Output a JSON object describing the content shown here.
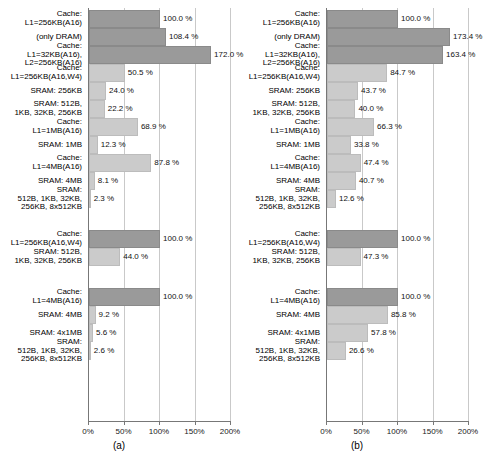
{
  "chart_data": [
    {
      "type": "bar",
      "orientation": "horizontal",
      "panel_id": "a",
      "caption": "(a)",
      "title": "",
      "xlabel": "",
      "ylabel": "",
      "xlim": [
        0,
        200
      ],
      "xticks": [
        0,
        50,
        100,
        150,
        200
      ],
      "xtick_labels": [
        "0%",
        "50%",
        "100%",
        "150%",
        "200%"
      ],
      "grid": true,
      "unit_suffix": "%",
      "groups": [
        {
          "group_index": 0,
          "bars": [
            {
              "label": "Cache:\nL1=256KB(A16)",
              "value": 100.0,
              "value_label": "100.0 %",
              "shade": "dark"
            },
            {
              "label": "(only DRAM)",
              "value": 108.4,
              "value_label": "108.4 %",
              "shade": "dark"
            },
            {
              "label": "Cache:\nL1=32KB(A16),\nL2=256KB(A16)",
              "value": 172.0,
              "value_label": "172.0 %",
              "shade": "dark"
            },
            {
              "label": "Cache:\nL1=256KB(A16,W4)",
              "value": 50.5,
              "value_label": "50.5 %",
              "shade": "light"
            },
            {
              "label": "SRAM: 256KB",
              "value": 24.0,
              "value_label": "24.0 %",
              "shade": "light"
            },
            {
              "label": "SRAM: 512B,\n1KB, 32KB, 256KB",
              "value": 22.2,
              "value_label": "22.2 %",
              "shade": "light"
            },
            {
              "label": "Cache:\nL1=1MB(A16)",
              "value": 68.9,
              "value_label": "68.9 %",
              "shade": "light"
            },
            {
              "label": "SRAM: 1MB",
              "value": 12.3,
              "value_label": "12.3 %",
              "shade": "light"
            },
            {
              "label": "Cache:\nL1=4MB(A16)",
              "value": 87.8,
              "value_label": "87.8 %",
              "shade": "light"
            },
            {
              "label": "SRAM: 4MB",
              "value": 8.1,
              "value_label": "8.1 %",
              "shade": "light"
            },
            {
              "label": "SRAM:\n512B, 1KB, 32KB,\n256KB, 8x512KB",
              "value": 2.3,
              "value_label": "2.3 %",
              "shade": "light"
            }
          ]
        },
        {
          "group_index": 1,
          "bars": [
            {
              "label": "Cache:\nL1=256KB(A16,W4)",
              "value": 100.0,
              "value_label": "100.0 %",
              "shade": "dark"
            },
            {
              "label": "SRAM: 512B,\n1KB, 32KB, 256KB",
              "value": 44.0,
              "value_label": "44.0 %",
              "shade": "light"
            }
          ]
        },
        {
          "group_index": 2,
          "bars": [
            {
              "label": "Cache:\nL1=4MB(A16)",
              "value": 100.0,
              "value_label": "100.0 %",
              "shade": "dark"
            },
            {
              "label": "SRAM: 4MB",
              "value": 9.2,
              "value_label": "9.2 %",
              "shade": "light"
            },
            {
              "label": "SRAM: 4x1MB",
              "value": 5.6,
              "value_label": "5.6 %",
              "shade": "light"
            },
            {
              "label": "SRAM:\n512B, 1KB, 32KB,\n256KB, 8x512KB",
              "value": 2.6,
              "value_label": "2.6 %",
              "shade": "light"
            }
          ]
        }
      ]
    },
    {
      "type": "bar",
      "orientation": "horizontal",
      "panel_id": "b",
      "caption": "(b)",
      "title": "",
      "xlabel": "",
      "ylabel": "",
      "xlim": [
        0,
        200
      ],
      "xticks": [
        0,
        50,
        100,
        150,
        200
      ],
      "xtick_labels": [
        "0%",
        "50%",
        "100%",
        "150%",
        "200%"
      ],
      "grid": true,
      "unit_suffix": "%",
      "groups": [
        {
          "group_index": 0,
          "bars": [
            {
              "label": "Cache:\nL1=256KB(A16)",
              "value": 100.0,
              "value_label": "100.0 %",
              "shade": "dark"
            },
            {
              "label": "(only DRAM)",
              "value": 173.4,
              "value_label": "173.4 %",
              "shade": "dark"
            },
            {
              "label": "Cache:\nL1=32KB(A16),\nL2=256KB(A16)",
              "value": 163.4,
              "value_label": "163.4 %",
              "shade": "dark"
            },
            {
              "label": "Cache:\nL1=256KB(A16,W4)",
              "value": 84.7,
              "value_label": "84.7 %",
              "shade": "light"
            },
            {
              "label": "SRAM: 256KB",
              "value": 43.7,
              "value_label": "43.7 %",
              "shade": "light"
            },
            {
              "label": "SRAM: 512B,\n1KB, 32KB, 256KB",
              "value": 40.0,
              "value_label": "40.0 %",
              "shade": "light"
            },
            {
              "label": "Cache:\nL1=1MB(A16)",
              "value": 66.3,
              "value_label": "66.3 %",
              "shade": "light"
            },
            {
              "label": "SRAM: 1MB",
              "value": 33.8,
              "value_label": "33.8 %",
              "shade": "light"
            },
            {
              "label": "Cache:\nL1=4MB(A16)",
              "value": 47.4,
              "value_label": "47.4 %",
              "shade": "light"
            },
            {
              "label": "SRAM: 4MB",
              "value": 40.7,
              "value_label": "40.7 %",
              "shade": "light"
            },
            {
              "label": "SRAM:\n512B, 1KB, 32KB,\n256KB, 8x512KB",
              "value": 12.6,
              "value_label": "12.6 %",
              "shade": "light"
            }
          ]
        },
        {
          "group_index": 1,
          "bars": [
            {
              "label": "Cache:\nL1=256KB(A16,W4)",
              "value": 100.0,
              "value_label": "100.0 %",
              "shade": "dark"
            },
            {
              "label": "SRAM: 512B,\n1KB, 32KB, 256KB",
              "value": 47.3,
              "value_label": "47.3 %",
              "shade": "light"
            }
          ]
        },
        {
          "group_index": 2,
          "bars": [
            {
              "label": "Cache:\nL1=4MB(A16)",
              "value": 100.0,
              "value_label": "100.0 %",
              "shade": "dark"
            },
            {
              "label": "SRAM: 4MB",
              "value": 85.8,
              "value_label": "85.8 %",
              "shade": "light"
            },
            {
              "label": "SRAM: 4x1MB",
              "value": 57.8,
              "value_label": "57.8 %",
              "shade": "light"
            },
            {
              "label": "SRAM:\n512B, 1KB, 32KB,\n256KB, 8x512KB",
              "value": 26.6,
              "value_label": "26.6 %",
              "shade": "light"
            }
          ]
        }
      ]
    }
  ],
  "colors": {
    "bar_dark": "#9a9a9a",
    "bar_light": "#cbcbcb",
    "grid": "#c9c9c9",
    "axis": "#777777",
    "text": "#000000",
    "background": "#ffffff"
  }
}
